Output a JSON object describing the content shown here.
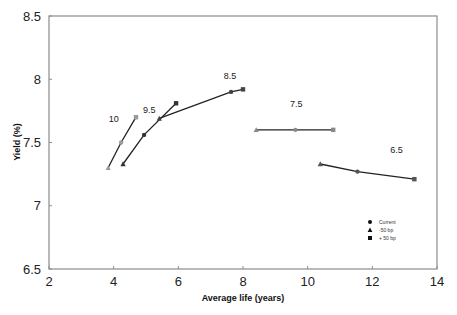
{
  "chart_data": {
    "type": "scatter",
    "title": "",
    "xlabel": "Average life (years)",
    "ylabel": "Yield (%)",
    "xlim": [
      2,
      14
    ],
    "ylim": [
      6.5,
      8.5
    ],
    "xticks": [
      2,
      4,
      6,
      8,
      10,
      12,
      14
    ],
    "yticks": [
      6.5,
      7,
      7.5,
      8,
      8.5
    ],
    "xtick_labels": [
      "2",
      "4",
      "6",
      "8",
      "10",
      "12",
      "14"
    ],
    "ytick_labels": [
      "6.5",
      "7",
      "7.5",
      "8",
      "8.5"
    ],
    "grid": false,
    "legend_position": "lower right",
    "legend": [
      {
        "label": "Current",
        "marker": "circle"
      },
      {
        "label": "-50 bp",
        "marker": "triangle"
      },
      {
        "label": "+ 50 bp",
        "marker": "square"
      }
    ],
    "series": [
      {
        "name": "10",
        "label_pos": [
          4.0,
          7.66
        ],
        "marker_color": "#9a9a9a",
        "points": [
          {
            "scenario": "-50 bp",
            "x": 3.83,
            "y": 7.3
          },
          {
            "scenario": "Current",
            "x": 4.23,
            "y": 7.5
          },
          {
            "scenario": "+ 50 bp",
            "x": 4.69,
            "y": 7.7
          }
        ]
      },
      {
        "name": "9.5",
        "label_pos": [
          5.1,
          7.73
        ],
        "marker_color": "#333333",
        "points": [
          {
            "scenario": "-50 bp",
            "x": 4.29,
            "y": 7.33
          },
          {
            "scenario": "Current",
            "x": 4.94,
            "y": 7.56
          },
          {
            "scenario": "+ 50 bp",
            "x": 5.93,
            "y": 7.81
          }
        ]
      },
      {
        "name": "8.5",
        "label_pos": [
          7.6,
          8.0
        ],
        "marker_color": "#444444",
        "points": [
          {
            "scenario": "-50 bp",
            "x": 5.41,
            "y": 7.69
          },
          {
            "scenario": "Current",
            "x": 7.63,
            "y": 7.9
          },
          {
            "scenario": "+ 50 bp",
            "x": 8.0,
            "y": 7.92
          }
        ]
      },
      {
        "name": "7.5",
        "label_pos": [
          9.65,
          7.78
        ],
        "marker_color": "#8a8a8a",
        "points": [
          {
            "scenario": "-50 bp",
            "x": 8.41,
            "y": 7.6
          },
          {
            "scenario": "Current",
            "x": 9.62,
            "y": 7.6
          },
          {
            "scenario": "+ 50 bp",
            "x": 10.79,
            "y": 7.6
          }
        ]
      },
      {
        "name": "6.5",
        "label_pos": [
          12.75,
          7.42
        ],
        "marker_color": "#555555",
        "points": [
          {
            "scenario": "-50 bp",
            "x": 10.39,
            "y": 7.33
          },
          {
            "scenario": "Current",
            "x": 11.54,
            "y": 7.27
          },
          {
            "scenario": "+ 50 bp",
            "x": 13.3,
            "y": 7.21
          }
        ]
      }
    ]
  },
  "colors": {
    "axis": "#8c8c8c",
    "line": "#222222",
    "background": "#ffffff"
  }
}
